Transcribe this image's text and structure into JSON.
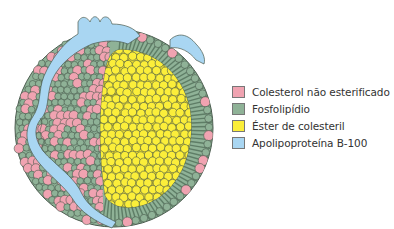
{
  "figure": {
    "colors": {
      "cholesterol": "#f0a3b1",
      "phospholipid": "#8fb297",
      "cholesteryl_ester": "#fbee3a",
      "apoB100": "#a9d6f2",
      "outline": "#4a5a4e",
      "phospholipid_tail": "#5e7d66"
    }
  },
  "legend": {
    "items": [
      {
        "label": "Colesterol não esterificado",
        "color": "#f0a3b1"
      },
      {
        "label": "Fosfolipídio",
        "color": "#8fb297"
      },
      {
        "label": "Éster de colesteril",
        "color": "#fbee3a"
      },
      {
        "label": "Apolipoproteína B-100",
        "color": "#a9d6f2"
      }
    ]
  }
}
